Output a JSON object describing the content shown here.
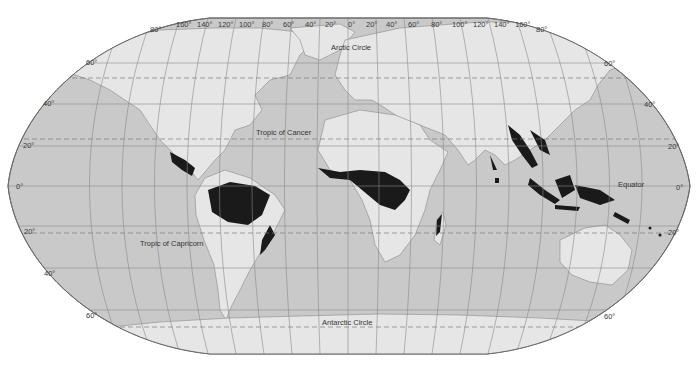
{
  "map": {
    "projection": "Robinson",
    "colors": {
      "ocean": "#c9c9c9",
      "land": "#e6e6e6",
      "rainforest": "#1a1a1a",
      "graticule": "#8a8a8a",
      "border": "#6a6a6a",
      "background": "#ffffff"
    },
    "longitude_labels_left": [
      "160°",
      "140°",
      "120°",
      "100°",
      "80°",
      "60°",
      "40°",
      "20°"
    ],
    "longitude_label_center": "0°",
    "longitude_labels_right": [
      "20°",
      "40°",
      "60°",
      "80°",
      "100°",
      "120°",
      "140°",
      "160°"
    ],
    "latitude_labels_left": [
      "80°",
      "60°",
      "40°",
      "20°",
      "0°",
      "20°",
      "40°",
      "60°"
    ],
    "latitude_labels_right": [
      "80°",
      "60°",
      "40°",
      "20°",
      "0°",
      "20°",
      "60°"
    ],
    "reference_lines": {
      "arctic_circle": "Arctic Circle",
      "tropic_of_cancer": "Tropic of Cancer",
      "equator": "Equator",
      "tropic_of_capricorn": "Tropic of Capricorn",
      "antarctic_circle": "Antarctic Circle"
    },
    "highlighted_regions": [
      "Central America",
      "Amazon Basin",
      "Atlantic Coast of Brazil",
      "West Africa",
      "Congo Basin",
      "Madagascar East Coast",
      "Western Ghats",
      "Sri Lanka",
      "Southeast Asia",
      "Indonesia",
      "New Guinea",
      "Northeast Australia",
      "Pacific Islands"
    ]
  }
}
